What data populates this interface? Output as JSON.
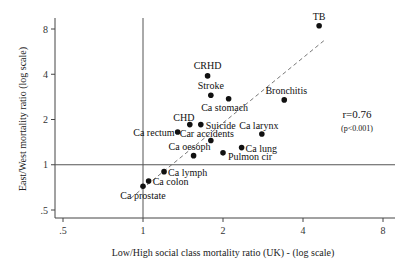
{
  "chart_data": {
    "type": "scatter",
    "title": "",
    "xlabel": "Low/High social class mortality ratio (UK) - (log scale)",
    "ylabel": "East/West mortality ratio (log scale)",
    "xscale": "log2",
    "yscale": "log2",
    "xlim": [
      0.5,
      8
    ],
    "ylim": [
      0.5,
      8
    ],
    "xticks": [
      ".5",
      "1",
      "2",
      "4",
      "8"
    ],
    "yticks": [
      ".5",
      "1",
      "2",
      "4",
      "8"
    ],
    "reference_lines": {
      "x": 1,
      "y": 1
    },
    "regression_line": {
      "style": "dashed",
      "from": [
        0.9,
        0.6
      ],
      "to": [
        4.8,
        6.7
      ]
    },
    "annotation": {
      "r": "r=0.76",
      "p": "(p<0.001)"
    },
    "grid": false,
    "points": [
      {
        "label": "TB",
        "x": 4.6,
        "y": 8.4
      },
      {
        "label": "CRHD",
        "x": 1.75,
        "y": 3.9
      },
      {
        "label": "Stroke",
        "x": 1.8,
        "y": 2.9
      },
      {
        "label": "Ca stomach",
        "x": 2.1,
        "y": 2.75
      },
      {
        "label": "Bronchitis",
        "x": 3.4,
        "y": 2.7
      },
      {
        "label": "CHD",
        "x": 1.5,
        "y": 1.85
      },
      {
        "label": "Suicide",
        "x": 1.65,
        "y": 1.85
      },
      {
        "label": "Ca rectum",
        "x": 1.35,
        "y": 1.65
      },
      {
        "label": "Car accidents",
        "x": 1.8,
        "y": 1.45
      },
      {
        "label": "Ca larynx",
        "x": 2.8,
        "y": 1.6
      },
      {
        "label": "Ca lung",
        "x": 2.35,
        "y": 1.3
      },
      {
        "label": "Ca oesoph",
        "x": 1.55,
        "y": 1.15
      },
      {
        "label": "Pulmon cir",
        "x": 2.0,
        "y": 1.2
      },
      {
        "label": "Ca lymph",
        "x": 1.2,
        "y": 0.9
      },
      {
        "label": "Ca colon",
        "x": 1.05,
        "y": 0.78
      },
      {
        "label": "Ca prostate",
        "x": 1.0,
        "y": 0.72
      }
    ]
  }
}
